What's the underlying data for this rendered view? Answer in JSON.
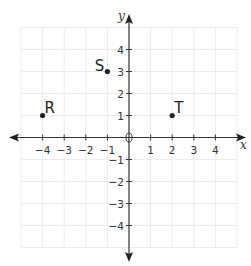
{
  "chart_data": {
    "type": "scatter",
    "title": "",
    "xlabel": "x",
    "ylabel": "y",
    "xlim": [
      -5,
      5
    ],
    "ylim": [
      -5,
      5
    ],
    "grid": true,
    "x_ticks": [
      -4,
      -3,
      -2,
      -1,
      1,
      2,
      3,
      4
    ],
    "y_ticks": [
      4,
      3,
      2,
      1,
      -1,
      -2,
      -3,
      -4
    ],
    "x_tick_labels": [
      "−4",
      "−3",
      "−2",
      "−1",
      "1",
      "2",
      "3",
      "4"
    ],
    "y_tick_labels": [
      "4",
      "3",
      "2",
      "1",
      "−1",
      "−2",
      "−3",
      "−4"
    ],
    "origin_label": "0",
    "points": [
      {
        "label": "R",
        "x": -4,
        "y": 1,
        "label_position": "top-right"
      },
      {
        "label": "S",
        "x": -1,
        "y": 3,
        "label_position": "top-left"
      },
      {
        "label": "T",
        "x": 2,
        "y": 1,
        "label_position": "top-right"
      }
    ],
    "colors": {
      "axis": "#333333",
      "grid": "#ececec",
      "point": "#222222"
    }
  }
}
